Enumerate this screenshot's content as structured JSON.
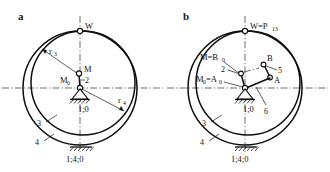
{
  "figure": {
    "type": "kinematic-diagram"
  },
  "panels": [
    {
      "id": "a",
      "letter": "a",
      "top_label": "W",
      "center_labels": {
        "m": "M",
        "m0": "M",
        "m0_sub": "0",
        "link": "2"
      },
      "radius_labels": [
        {
          "base": "r",
          "sub": "3"
        },
        {
          "base": "r",
          "sub": "4"
        }
      ],
      "circle_labels": [
        "3",
        "4"
      ],
      "pivot_label": "1;0",
      "ground_label": "1;4;0"
    },
    {
      "id": "b",
      "letter": "b",
      "top_label": {
        "base": "W=P",
        "sub": "13"
      },
      "center_labels": {
        "m_eq_b0": {
          "base": "M=B",
          "sub": "0"
        },
        "m0_eq_a0": {
          "base": "M",
          "sub1": "0",
          "mid": "=A",
          "sub2": "0"
        },
        "link2": "2",
        "link5": "5",
        "link6": "6",
        "point_a": "A",
        "point_b": "B"
      },
      "circle_labels": [
        "3",
        "4"
      ],
      "pivot_label": "1;0",
      "ground_label": "1;4;0"
    }
  ],
  "colors": {
    "stroke": "#0d0d0d",
    "centerline": "#2b2b2b",
    "background": "#ffffff"
  }
}
